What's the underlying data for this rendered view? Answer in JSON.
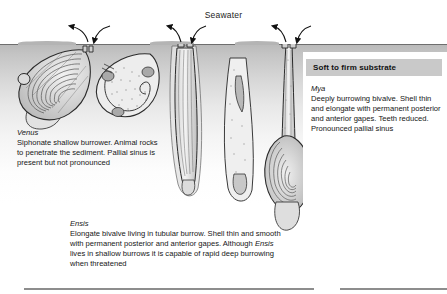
{
  "figure": {
    "seawater_label": "Seawater",
    "substrate_header": "Soft to firm substrate"
  },
  "captions": {
    "venus": {
      "species": "Venus",
      "text": "Siphonate shallow burrower. Animal rocks to penetrate the sediment. Pallial sinus is present but not pronounced"
    },
    "ensis": {
      "species": "Ensis",
      "line1": "Elongate bivalve living in tubular burrow. Shell thin and smooth with permanent posterior and anterior gapes. Although ",
      "species_inline": "Ensis",
      "line2": " lives in shallow burrows it is capable of rapid deep burrowing when threatened"
    },
    "mya": {
      "species": "Mya",
      "text": "Deeply burrowing bivalve. Shell thin and elongate with permanent posterior and anterior gapes. Teeth reduced. Pronounced pallial sinus"
    }
  },
  "colors": {
    "sediment_surface": "#b9b9b9",
    "surface_line": "#6e6e6e",
    "header_background": "#c9c9c9",
    "ink": "#1a1a1a",
    "rule": "#8d8d8d"
  },
  "icons": {
    "inhalant_arrow": "inhalant-current-arrow",
    "exhalant_arrow": "exhalant-current-arrow"
  }
}
